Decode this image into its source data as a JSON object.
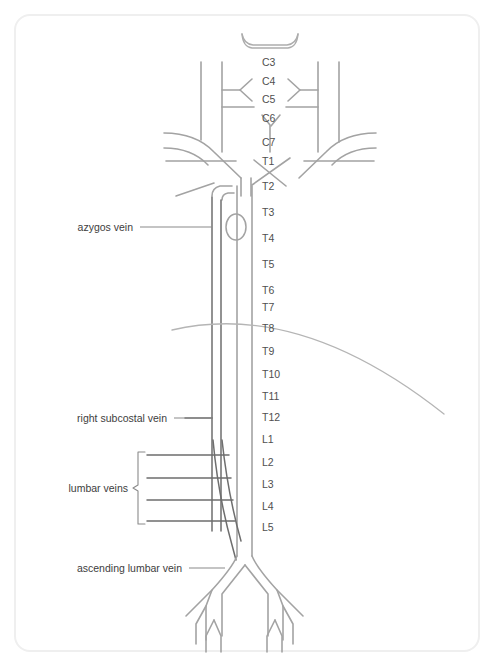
{
  "figure": {
    "background_color": "#ffffff",
    "card_border_color": "#efefef",
    "vessel_color": "#a3a3a3",
    "vessel_dark_color": "#6e6e6e",
    "diaphragm_color": "#b5b5b5",
    "label_color": "#4f4f4f",
    "leader_color": "#8a8a8a"
  },
  "vertebral_labels": [
    {
      "text": "C3",
      "x": 262,
      "y": 66
    },
    {
      "text": "C4",
      "x": 262,
      "y": 85
    },
    {
      "text": "C5",
      "x": 262,
      "y": 103
    },
    {
      "text": "C6",
      "x": 262,
      "y": 122
    },
    {
      "text": "C7",
      "x": 262,
      "y": 146
    },
    {
      "text": "T1",
      "x": 262,
      "y": 165
    },
    {
      "text": "T2",
      "x": 262,
      "y": 190
    },
    {
      "text": "T3",
      "x": 262,
      "y": 216
    },
    {
      "text": "T4",
      "x": 262,
      "y": 242
    },
    {
      "text": "T5",
      "x": 262,
      "y": 268
    },
    {
      "text": "T6",
      "x": 262,
      "y": 294
    },
    {
      "text": "T7",
      "x": 262,
      "y": 311
    },
    {
      "text": "T8",
      "x": 262,
      "y": 332
    },
    {
      "text": "T9",
      "x": 262,
      "y": 355
    },
    {
      "text": "T10",
      "x": 262,
      "y": 378
    },
    {
      "text": "T11",
      "x": 262,
      "y": 400
    },
    {
      "text": "T12",
      "x": 262,
      "y": 421
    },
    {
      "text": "L1",
      "x": 262,
      "y": 443
    },
    {
      "text": "L2",
      "x": 262,
      "y": 466
    },
    {
      "text": "L3",
      "x": 262,
      "y": 488
    },
    {
      "text": "L4",
      "x": 262,
      "y": 510
    },
    {
      "text": "L5",
      "x": 262,
      "y": 531
    }
  ],
  "annotations": [
    {
      "name": "azygos-vein",
      "text": "azygos vein",
      "text_x": 133,
      "text_y": 231,
      "leader": "M 140 227 L 212 227"
    },
    {
      "name": "right-subcostal-vein",
      "text": "right subcostal vein",
      "text_x": 167,
      "text_y": 422,
      "leader": "M 174 418 L 212 418"
    },
    {
      "name": "lumbar-veins",
      "text": "lumbar veins",
      "text_x": 128,
      "text_y": 492,
      "brace": "M 145 452 L 138 452 L 138 485 L 133 488 L 138 491 L 138 524 L 145 524"
    },
    {
      "name": "ascending-lumbar-vein",
      "text": "ascending lumbar vein",
      "text_x": 182,
      "text_y": 572,
      "leader": "M 189 568 L 225 568"
    }
  ],
  "structures": [
    {
      "name": "superior-arch",
      "label": "superior venous arch"
    },
    {
      "name": "left-jugular-trunk",
      "label": "left internal jugular vein"
    },
    {
      "name": "right-jugular-trunk",
      "label": "right internal jugular vein"
    },
    {
      "name": "left-subclavian-vein",
      "label": "left subclavian vein"
    },
    {
      "name": "right-subclavian-vein",
      "label": "right subclavian vein"
    },
    {
      "name": "brachiocephalic-veins",
      "label": "brachiocephalic veins"
    },
    {
      "name": "superior-vena-cava",
      "label": "superior vena cava"
    },
    {
      "name": "azygos-arch",
      "label": "azygos arch"
    },
    {
      "name": "azygos-trunk",
      "label": "azygos vein trunk"
    },
    {
      "name": "inferior-vena-cava",
      "label": "inferior vena cava"
    },
    {
      "name": "diaphragm-outline",
      "label": "diaphragm"
    },
    {
      "name": "lumbar-vein-1",
      "label": "lumbar vein L1"
    },
    {
      "name": "lumbar-vein-2",
      "label": "lumbar vein L2"
    },
    {
      "name": "lumbar-vein-3",
      "label": "lumbar vein L3"
    },
    {
      "name": "lumbar-vein-4",
      "label": "lumbar vein L4"
    },
    {
      "name": "ascending-lumbar-trunk",
      "label": "ascending lumbar vein trunk"
    },
    {
      "name": "iliac-bifurcation",
      "label": "common iliac veins bifurcation"
    }
  ]
}
